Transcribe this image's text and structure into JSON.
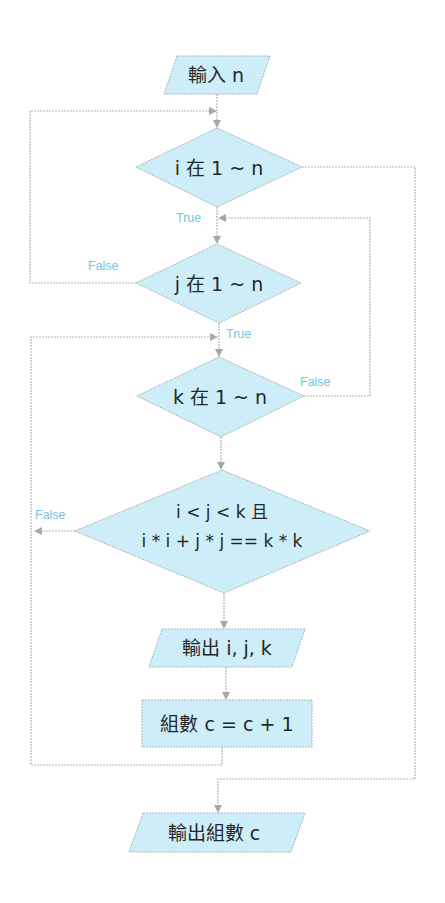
{
  "diagram": {
    "type": "flowchart",
    "colors": {
      "node_fill": "#cdeef8",
      "node_border": "#a9b6bc",
      "connector": "#b3b3b3",
      "label": "#74c3e3",
      "text": "#262626"
    },
    "nodes": {
      "input_n": {
        "shape": "parallelogram",
        "text": "輸入 n"
      },
      "loop_i": {
        "shape": "diamond",
        "text": "i 在 1 ~ n"
      },
      "loop_j": {
        "shape": "diamond",
        "text": "j 在 1 ~ n"
      },
      "loop_k": {
        "shape": "diamond",
        "text": "k 在 1 ~ n"
      },
      "condition": {
        "shape": "diamond",
        "line1": "i < j < k 且",
        "line2": "i * i + j * j == k * k"
      },
      "output_ijk": {
        "shape": "parallelogram",
        "text": "輸出 i, j, k"
      },
      "increment": {
        "shape": "rectangle",
        "text": "組數 c = c + 1"
      },
      "output_c": {
        "shape": "parallelogram",
        "text": "輸出組數 c"
      }
    },
    "edge_labels": {
      "i_true": "True",
      "j_false": "False",
      "j_true": "True",
      "k_false": "False",
      "cond_false": "False"
    },
    "edges": [
      {
        "from": "input_n",
        "to": "loop_i"
      },
      {
        "from": "loop_i",
        "to": "loop_j",
        "label": "True"
      },
      {
        "from": "loop_i",
        "to": "output_c",
        "label": ""
      },
      {
        "from": "loop_j",
        "to": "loop_k",
        "label": "True"
      },
      {
        "from": "loop_j",
        "to": "loop_i",
        "label": "False"
      },
      {
        "from": "loop_k",
        "to": "condition"
      },
      {
        "from": "loop_k",
        "to": "loop_j",
        "label": "False"
      },
      {
        "from": "condition",
        "to": "output_ijk"
      },
      {
        "from": "condition",
        "to": "loop_k",
        "label": "False"
      },
      {
        "from": "output_ijk",
        "to": "increment"
      },
      {
        "from": "increment",
        "to": "loop_k"
      }
    ]
  }
}
